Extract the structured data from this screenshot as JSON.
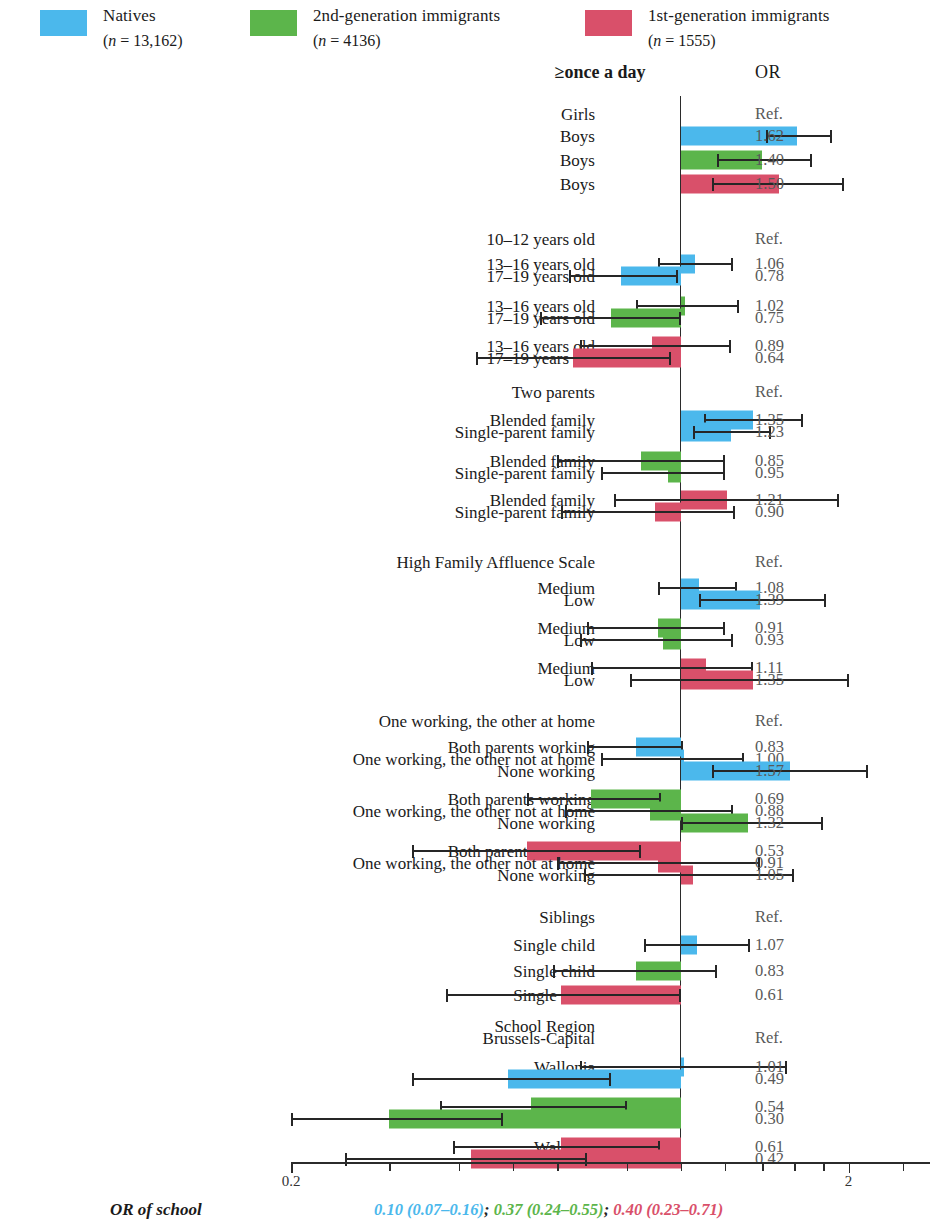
{
  "colors": {
    "natives": "#4BB8EC",
    "second_gen": "#5CB54B",
    "first_gen": "#D9506A",
    "line": "#262626",
    "or_text": "#595959"
  },
  "legend": [
    {
      "label": "Natives",
      "n": "(n = 13,162)",
      "color_key": "natives"
    },
    {
      "label": "2nd-generation immigrants",
      "n": "(n = 4136)",
      "color_key": "second_gen"
    },
    {
      "label": "1st-generation immigrants",
      "n": "(n = 1555)",
      "color_key": "first_gen"
    }
  ],
  "header": {
    "outcome_title": "≥once a day",
    "or_title": "OR"
  },
  "axis": {
    "scale": "log",
    "xmin": 0.2,
    "xmax": 2.8,
    "tick_values": [
      0.2,
      0.3,
      0.4,
      0.5,
      0.6,
      0.8,
      1,
      1.2,
      1.4,
      1.6,
      1.8,
      2,
      2.5
    ],
    "labeled_ticks": [
      {
        "value": 0.2,
        "label": "0.2"
      },
      {
        "value": 2,
        "label": "2"
      }
    ],
    "reference_value": 1
  },
  "footer": {
    "label": "OR of school",
    "values": [
      {
        "text": "0.10 (0.07–0.16)",
        "color_key": "natives"
      },
      {
        "text": "0.37 (0.24–0.55)",
        "color_key": "second_gen"
      },
      {
        "text": "0.40 (0.23–0.71)",
        "color_key": "first_gen"
      }
    ],
    "separator": "; "
  },
  "chart_data": {
    "type": "bar",
    "title": "≥once a day",
    "xlabel": "Odds Ratio (log scale)",
    "ylabel": "",
    "xlim": [
      0.2,
      2.8
    ],
    "reference_line": 1,
    "legend_position": "top",
    "groups": [
      {
        "name": "Sex",
        "rows": [
          {
            "label": "Girls",
            "or": null,
            "or_text": "Ref.",
            "ci": null,
            "color_key": null
          },
          {
            "label": "Boys",
            "or": 1.62,
            "or_text": "1.62",
            "ci": [
              1.42,
              1.87
            ],
            "color_key": "natives"
          },
          {
            "label": "Boys",
            "or": 1.4,
            "or_text": "1.40",
            "ci": [
              1.16,
              1.72
            ],
            "color_key": "second_gen"
          },
          {
            "label": "Boys",
            "or": 1.5,
            "or_text": "1.50",
            "ci": [
              1.14,
              1.96
            ],
            "color_key": "first_gen"
          }
        ]
      },
      {
        "name": "Age",
        "rows": [
          {
            "label": "10–12 years old",
            "or": null,
            "or_text": "Ref.",
            "ci": null,
            "color_key": null
          },
          {
            "label": "13–16 years old",
            "or": 1.06,
            "or_text": "1.06",
            "ci": [
              0.91,
              1.24
            ],
            "color_key": "natives"
          },
          {
            "label": "17–19 years old",
            "or": 0.78,
            "or_text": "0.78",
            "ci": [
              0.63,
              0.99
            ],
            "color_key": "natives"
          },
          {
            "label": "13–16 years old",
            "or": 1.02,
            "or_text": "1.02",
            "ci": [
              0.83,
              1.27
            ],
            "color_key": "second_gen"
          },
          {
            "label": "17–19 years old",
            "or": 0.75,
            "or_text": "0.75",
            "ci": [
              0.56,
              1.0
            ],
            "color_key": "second_gen"
          },
          {
            "label": "13–16 years old",
            "or": 0.89,
            "or_text": "0.89",
            "ci": [
              0.66,
              1.23
            ],
            "color_key": "first_gen"
          },
          {
            "label": "17–19 years old",
            "or": 0.64,
            "or_text": "0.64",
            "ci": [
              0.43,
              0.96
            ],
            "color_key": "first_gen"
          }
        ]
      },
      {
        "name": "Family structure",
        "rows": [
          {
            "label": "Two parents",
            "or": null,
            "or_text": "Ref.",
            "ci": null,
            "color_key": null
          },
          {
            "label": "Blended family",
            "or": 1.35,
            "or_text": "1.35",
            "ci": [
              1.1,
              1.66
            ],
            "color_key": "natives"
          },
          {
            "label": "Single-parent family",
            "or": 1.23,
            "or_text": "1.23",
            "ci": [
              1.05,
              1.45
            ],
            "color_key": "natives"
          },
          {
            "label": "Blended family",
            "or": 0.85,
            "or_text": "0.85",
            "ci": [
              0.6,
              1.2
            ],
            "color_key": "second_gen"
          },
          {
            "label": "Single-parent family",
            "or": 0.95,
            "or_text": "0.95",
            "ci": [
              0.72,
              1.2
            ],
            "color_key": "second_gen"
          },
          {
            "label": "Blended family",
            "or": 1.21,
            "or_text": "1.21",
            "ci": [
              0.76,
              1.92
            ],
            "color_key": "first_gen"
          },
          {
            "label": "Single-parent family",
            "or": 0.9,
            "or_text": "0.90",
            "ci": [
              0.61,
              1.25
            ],
            "color_key": "first_gen"
          }
        ]
      },
      {
        "name": "Family Affluence Scale",
        "rows": [
          {
            "label": "High Family Affluence Scale",
            "or": null,
            "or_text": "Ref.",
            "ci": null,
            "color_key": null
          },
          {
            "label": "Medium",
            "or": 1.08,
            "or_text": "1.08",
            "ci": [
              0.91,
              1.26
            ],
            "color_key": "natives"
          },
          {
            "label": "Low",
            "or": 1.39,
            "or_text": "1.39",
            "ci": [
              1.08,
              1.82
            ],
            "color_key": "natives"
          },
          {
            "label": "Medium",
            "or": 0.91,
            "or_text": "0.91",
            "ci": [
              0.68,
              1.2
            ],
            "color_key": "second_gen"
          },
          {
            "label": "Low",
            "or": 0.93,
            "or_text": "0.93",
            "ci": [
              0.66,
              1.24
            ],
            "color_key": "second_gen"
          },
          {
            "label": "Medium",
            "or": 1.11,
            "or_text": "1.11",
            "ci": [
              0.69,
              1.35
            ],
            "color_key": "first_gen"
          },
          {
            "label": "Low",
            "or": 1.35,
            "or_text": "1.35",
            "ci": [
              0.81,
              2.0
            ],
            "color_key": "first_gen"
          }
        ]
      },
      {
        "name": "Parental employment",
        "rows": [
          {
            "label": "One working, the other at home",
            "or": null,
            "or_text": "Ref.",
            "ci": null,
            "color_key": null
          },
          {
            "label": "Both parents working",
            "or": 0.83,
            "or_text": "0.83",
            "ci": [
              0.68,
              1.01
            ],
            "color_key": "natives"
          },
          {
            "label": "One working, the other not at home",
            "or": 1.0,
            "or_text": "1.00",
            "ci": [
              0.72,
              1.3
            ],
            "color_key": "natives"
          },
          {
            "label": "None working",
            "or": 1.57,
            "or_text": "1.57",
            "ci": [
              1.14,
              2.17
            ],
            "color_key": "natives"
          },
          {
            "label": "Both parents working",
            "or": 0.69,
            "or_text": "0.69",
            "ci": [
              0.53,
              0.92
            ],
            "color_key": "second_gen"
          },
          {
            "label": "One working, the other not at home",
            "or": 0.88,
            "or_text": "0.88",
            "ci": [
              0.62,
              1.24
            ],
            "color_key": "second_gen"
          },
          {
            "label": "None working",
            "or": 1.32,
            "or_text": "1.32",
            "ci": [
              1.0,
              1.8
            ],
            "color_key": "second_gen"
          },
          {
            "label": "Both parents working",
            "or": 0.53,
            "or_text": "0.53",
            "ci": [
              0.33,
              0.85
            ],
            "color_key": "first_gen"
          },
          {
            "label": "One working, the other not at home",
            "or": 0.91,
            "or_text": "0.91",
            "ci": [
              0.6,
              1.39
            ],
            "color_key": "first_gen"
          },
          {
            "label": "None working",
            "or": 1.05,
            "or_text": "1.05",
            "ci": [
              0.67,
              1.6
            ],
            "color_key": "first_gen"
          }
        ]
      },
      {
        "name": "Siblings",
        "rows": [
          {
            "label": "Siblings",
            "or": null,
            "or_text": "Ref.",
            "ci": null,
            "color_key": null
          },
          {
            "label": "Single child",
            "or": 1.07,
            "or_text": "1.07",
            "ci": [
              0.86,
              1.33
            ],
            "color_key": "natives"
          },
          {
            "label": "Single child",
            "or": 0.83,
            "or_text": "0.83",
            "ci": [
              0.59,
              1.16
            ],
            "color_key": "second_gen"
          },
          {
            "label": "Single child",
            "or": 0.61,
            "or_text": "0.61",
            "ci": [
              0.38,
              1.0
            ],
            "color_key": "first_gen"
          }
        ]
      },
      {
        "name": "School Region",
        "rows": [
          {
            "label": "School Region",
            "or": null,
            "or_text": "",
            "ci": null,
            "color_key": null
          },
          {
            "label": "Brussels-Capital",
            "or": null,
            "or_text": "Ref.",
            "ci": null,
            "color_key": null
          },
          {
            "label": "Wallonia",
            "or": 1.01,
            "or_text": "1.01",
            "ci": [
              0.66,
              1.55
            ],
            "color_key": "natives"
          },
          {
            "label": "Flanders",
            "or": 0.49,
            "or_text": "0.49",
            "ci": [
              0.33,
              0.75
            ],
            "color_key": "natives"
          },
          {
            "label": "Wallonia",
            "or": 0.54,
            "or_text": "0.54",
            "ci": [
              0.37,
              0.8
            ],
            "color_key": "second_gen"
          },
          {
            "label": "Flanders",
            "or": 0.3,
            "or_text": "0.30",
            "ci": [
              0.2,
              0.48
            ],
            "color_key": "second_gen"
          },
          {
            "label": "Wallonia",
            "or": 0.61,
            "or_text": "0.61",
            "ci": [
              0.39,
              0.92
            ],
            "color_key": "first_gen"
          },
          {
            "label": "Flanders",
            "or": 0.42,
            "or_text": "0.42",
            "ci": [
              0.25,
              0.68
            ],
            "color_key": "first_gen"
          }
        ]
      }
    ]
  }
}
